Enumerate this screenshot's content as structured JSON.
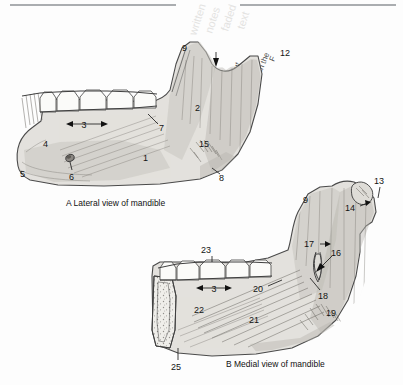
{
  "page": {
    "background_color": "#fdfdfd",
    "bone_fill_color": "#e3e1dd",
    "ink_color": "#141414",
    "rule_color": "#8e9296"
  },
  "figures": [
    {
      "id": "figure-a",
      "letter": "A",
      "caption": "A  Lateral view of mandible",
      "caption_letter": "A",
      "caption_text": "Lateral view of mandible",
      "labels": [
        {
          "id": "1",
          "text": "1",
          "x": 146,
          "y": 158
        },
        {
          "id": "2",
          "text": "2",
          "x": 198,
          "y": 108
        },
        {
          "id": "3",
          "text": "3",
          "x": 88,
          "y": 128,
          "has_double_arrow": true
        },
        {
          "id": "4",
          "text": "4",
          "x": 43,
          "y": 144
        },
        {
          "id": "5",
          "text": "5",
          "x": 22,
          "y": 174
        },
        {
          "id": "6",
          "text": "6",
          "x": 72,
          "y": 173
        },
        {
          "id": "7",
          "text": "7",
          "x": 160,
          "y": 127
        },
        {
          "id": "8",
          "text": "8",
          "x": 220,
          "y": 177
        },
        {
          "id": "9",
          "text": "9",
          "x": 185,
          "y": 48
        },
        {
          "id": "12",
          "text": "12",
          "x": 283,
          "y": 53
        },
        {
          "id": "15",
          "text": "15",
          "x": 203,
          "y": 144
        }
      ],
      "notch_arrow": true
    },
    {
      "id": "figure-b",
      "letter": "B",
      "caption": "B  Medial view of mandible",
      "caption_letter": "B",
      "caption_text": "Medial view of mandible",
      "labels": [
        {
          "id": "3",
          "text": "3",
          "x": 212,
          "y": 290,
          "has_double_arrow": true
        },
        {
          "id": "9",
          "text": "9",
          "x": 306,
          "y": 200
        },
        {
          "id": "13",
          "text": "13",
          "x": 378,
          "y": 181
        },
        {
          "id": "14",
          "text": "14",
          "x": 353,
          "y": 208
        },
        {
          "id": "16",
          "text": "16",
          "x": 334,
          "y": 253
        },
        {
          "id": "17",
          "text": "17",
          "x": 309,
          "y": 244
        },
        {
          "id": "18",
          "text": "18",
          "x": 320,
          "y": 296
        },
        {
          "id": "19",
          "text": "19",
          "x": 329,
          "y": 313
        },
        {
          "id": "20",
          "text": "20",
          "x": 257,
          "y": 289
        },
        {
          "id": "21",
          "text": "21",
          "x": 252,
          "y": 320
        },
        {
          "id": "22",
          "text": "22",
          "x": 197,
          "y": 310
        },
        {
          "id": "23",
          "text": "23",
          "x": 206,
          "y": 250
        },
        {
          "id": "25",
          "text": "25",
          "x": 174,
          "y": 367
        }
      ]
    }
  ],
  "top_rules": [
    {
      "id": "rule-left",
      "x1": 10,
      "x2": 176,
      "y": 5
    },
    {
      "id": "rule-right",
      "x1": 240,
      "x2": 396,
      "y": 5
    }
  ],
  "ghost_text": {
    "note": "faint bleed-through handwriting at top of page",
    "fragments": [
      "ut",
      "ain",
      "in the",
      "F"
    ]
  }
}
